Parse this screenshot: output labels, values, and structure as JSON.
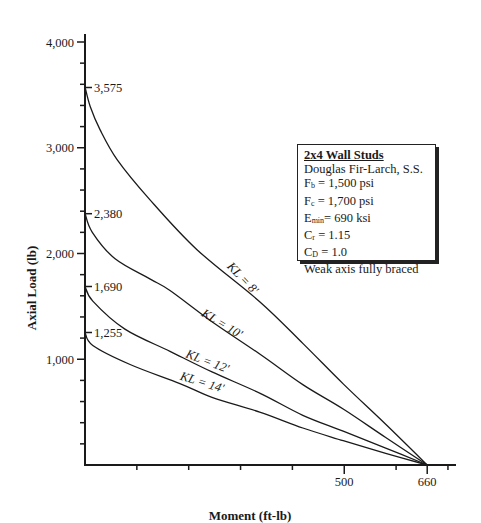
{
  "chart_data": {
    "type": "line",
    "title": "",
    "xlabel": "Moment (ft-lb)",
    "ylabel": "Axial Load (lb)",
    "xlim": [
      0,
      710
    ],
    "ylim": [
      0,
      4000
    ],
    "grid": false,
    "x_ticks_labeled": [
      {
        "value": 500,
        "label": "500"
      },
      {
        "value": 660,
        "label": "660"
      }
    ],
    "x_ticks_minor": [
      100,
      200,
      300,
      400,
      600,
      700
    ],
    "y_ticks_labeled": [
      {
        "value": 1000,
        "label": "1,000"
      },
      {
        "value": 2000,
        "label": "2,000"
      },
      {
        "value": 3000,
        "label": "3,000"
      },
      {
        "value": 4000,
        "label": "4,000"
      }
    ],
    "y_ticks_minor": [
      200,
      400,
      600,
      800,
      1200,
      1400,
      1600,
      1800,
      2200,
      2400,
      2600,
      2800,
      3200,
      3400,
      3600,
      3800
    ],
    "y_annotations": [
      {
        "value": 3575,
        "label": "3,575"
      },
      {
        "value": 2380,
        "label": "2,380"
      },
      {
        "value": 1690,
        "label": "1,690"
      },
      {
        "value": 1255,
        "label": "1,255"
      }
    ],
    "series": [
      {
        "name": "KL = 8'",
        "points": [
          [
            0,
            3575
          ],
          [
            10,
            3390
          ],
          [
            29,
            3172
          ],
          [
            62,
            2888
          ],
          [
            125,
            2510
          ],
          [
            216,
            2036
          ],
          [
            337,
            1544
          ],
          [
            420,
            1150
          ],
          [
            498,
            767
          ],
          [
            580,
            385
          ],
          [
            660,
            0
          ]
        ]
      },
      {
        "name": "KL = 10'",
        "points": [
          [
            0,
            2380
          ],
          [
            14,
            2200
          ],
          [
            58,
            1950
          ],
          [
            125,
            1760
          ],
          [
            164,
            1650
          ],
          [
            245,
            1355
          ],
          [
            337,
            1050
          ],
          [
            420,
            760
          ],
          [
            498,
            530
          ],
          [
            580,
            260
          ],
          [
            660,
            0
          ]
        ]
      },
      {
        "name": "KL = 12'",
        "points": [
          [
            0,
            1690
          ],
          [
            15,
            1550
          ],
          [
            77,
            1285
          ],
          [
            164,
            1075
          ],
          [
            245,
            880
          ],
          [
            337,
            680
          ],
          [
            420,
            470
          ],
          [
            498,
            320
          ],
          [
            580,
            160
          ],
          [
            660,
            0
          ]
        ]
      },
      {
        "name": "KL = 14'",
        "points": [
          [
            0,
            1255
          ],
          [
            15,
            1130
          ],
          [
            87,
            950
          ],
          [
            183,
            770
          ],
          [
            245,
            640
          ],
          [
            337,
            500
          ],
          [
            420,
            350
          ],
          [
            498,
            230
          ],
          [
            580,
            110
          ],
          [
            660,
            0
          ]
        ]
      }
    ],
    "legend": {
      "position": "upper right (text box)",
      "title": "2x4 Wall Studs",
      "lines": [
        "Douglas Fir-Larch, S.S.",
        "Fb = 1,500 psi",
        "Fc = 1,700 psi",
        "Emin= 690 ksi",
        "Cr = 1.15",
        "CD = 1.0",
        "Weak axis fully braced"
      ]
    }
  },
  "axes": {
    "xlabel": "Moment (ft-lb)",
    "ylabel": "Axial Load (lb)",
    "x_labels": {
      "t500": "500",
      "t660": "660"
    },
    "y_labels": {
      "t1000": "1,000",
      "t2000": "2,000",
      "t3000": "3,000",
      "t4000": "4,000"
    },
    "annotations": {
      "a3575": "3,575",
      "a2380": "2,380",
      "a1690": "1,690",
      "a1255": "1,255"
    }
  },
  "curve_labels": {
    "kl8": "KL = 8'",
    "kl10": "KL = 10'",
    "kl12": "KL = 12'",
    "kl14": "KL = 14'"
  },
  "legend": {
    "title": "2x4 Wall Studs",
    "species": "Douglas Fir-Larch, S.S.",
    "fb": {
      "sym": "F",
      "sub": "b",
      "rest": " = 1,500 psi"
    },
    "fc": {
      "sym": "F",
      "sub": "c",
      "rest": " = 1,700 psi"
    },
    "emin": {
      "sym": "E",
      "sub": "min",
      "rest": "= 690 ksi"
    },
    "cr": {
      "sym": "C",
      "sub": "r",
      "rest": " = 1.15"
    },
    "cd": {
      "sym": "C",
      "sub": "D",
      "rest": " = 1.0"
    },
    "note": "Weak axis fully braced"
  },
  "colors": {
    "line": "#1a1a1a",
    "background": "#ffffff"
  }
}
